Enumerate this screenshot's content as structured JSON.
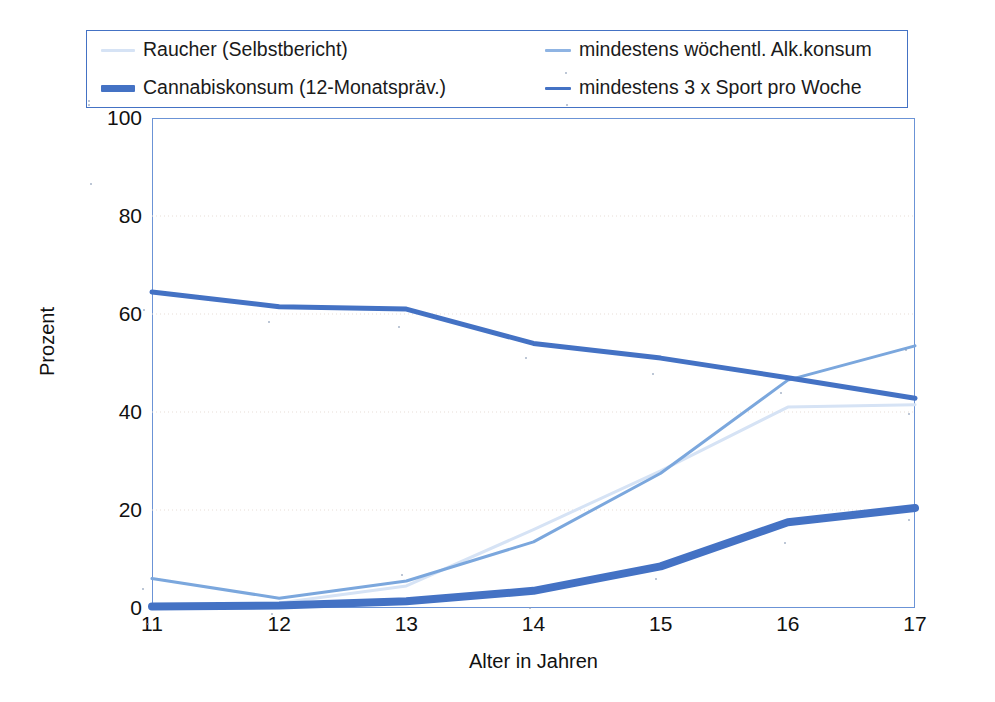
{
  "chart_data": {
    "type": "line",
    "title": "",
    "xlabel": "Alter in Jahren",
    "ylabel": "Prozent",
    "categories": [
      "11",
      "12",
      "13",
      "14",
      "15",
      "16",
      "17"
    ],
    "x": [
      11,
      12,
      13,
      14,
      15,
      16,
      17
    ],
    "xlim": [
      11,
      17
    ],
    "ylim": [
      0,
      100
    ],
    "yticks": [
      "0",
      "20",
      "40",
      "60",
      "80",
      "100"
    ],
    "ytick_values": [
      0,
      20,
      40,
      60,
      80,
      100
    ],
    "grid": "horizontal-dotted",
    "legend_position": "top",
    "series": [
      {
        "name": "Raucher (Selbstbericht)",
        "color": "#d6e3f5",
        "width": 3,
        "values": [
          0.5,
          1.0,
          4.5,
          16.0,
          28.0,
          41.0,
          41.5
        ]
      },
      {
        "name": "mindestens wöchentl. Alk.konsum",
        "color": "#7ba7dd",
        "width": 3,
        "values": [
          6.0,
          2.0,
          5.5,
          13.5,
          27.5,
          46.5,
          53.5
        ]
      },
      {
        "name": "Cannabiskonsum (12-Monatspräv.)",
        "color": "#4472c4",
        "width": 8,
        "values": [
          0.3,
          0.5,
          1.4,
          3.5,
          8.5,
          17.5,
          20.4
        ]
      },
      {
        "name": "mindestens 3 x Sport pro Woche",
        "color": "#4472c4",
        "width": 5,
        "values": [
          64.5,
          61.5,
          61.0,
          54.0,
          51.0,
          47.0,
          42.8
        ]
      }
    ]
  },
  "legend": {
    "items": [
      {
        "label": "Raucher (Selbstbericht)",
        "swatch": "line-swatch-raucher"
      },
      {
        "label": "mindestens wöchentl. Alk.konsum",
        "swatch": "line-swatch-alkohol"
      },
      {
        "label": "Cannabiskonsum (12-Monatspräv.)",
        "swatch": "line-swatch-cannabis"
      },
      {
        "label": "mindestens 3 x Sport pro Woche",
        "swatch": "line-swatch-sport"
      }
    ]
  },
  "axes": {
    "y_title": "Prozent",
    "x_title": "Alter in Jahren",
    "y_ticks": [
      "100",
      "80",
      "60",
      "40",
      "20",
      "0"
    ],
    "x_ticks": [
      "11",
      "12",
      "13",
      "14",
      "15",
      "16",
      "17"
    ]
  },
  "colors": {
    "raucher": "#d6e3f5",
    "alkohol": "#7ba7dd",
    "cannabis": "#4472c4",
    "sport": "#4472c4",
    "frame": "#6b93d6",
    "gridline": "#e7ddd6",
    "background": "#ffffff"
  }
}
